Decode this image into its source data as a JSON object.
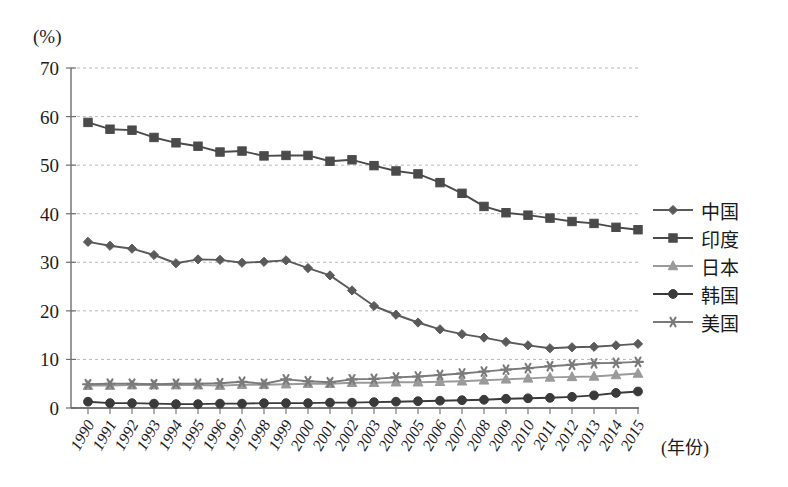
{
  "chart_data": {
    "type": "line",
    "title": "",
    "subtitle": "",
    "xlabel": "(年份)",
    "ylabel": "(%)",
    "ylim": [
      0,
      70
    ],
    "yticks": [
      0,
      10,
      20,
      30,
      40,
      50,
      60,
      70
    ],
    "grid": true,
    "legend_position": "right",
    "categories": [
      "1990",
      "1991",
      "1992",
      "1993",
      "1994",
      "1995",
      "1996",
      "1997",
      "1998",
      "1999",
      "2000",
      "2001",
      "2002",
      "2003",
      "2004",
      "2005",
      "2006",
      "2007",
      "2008",
      "2009",
      "2010",
      "2011",
      "2012",
      "2013",
      "2014",
      "2015"
    ],
    "series": [
      {
        "name": "中国",
        "marker": "diamond",
        "color": "#5a5a5a",
        "values": [
          34.2,
          33.4,
          32.8,
          31.5,
          29.8,
          30.6,
          30.5,
          29.9,
          30.1,
          30.4,
          28.8,
          27.3,
          24.2,
          21.0,
          19.2,
          17.6,
          16.2,
          15.2,
          14.5,
          13.6,
          12.9,
          12.3,
          12.5,
          12.6,
          12.9,
          13.2
        ]
      },
      {
        "name": "印度",
        "marker": "square",
        "color": "#4a4a4a",
        "values": [
          58.8,
          57.4,
          57.2,
          55.7,
          54.6,
          53.9,
          52.7,
          52.9,
          51.9,
          52.0,
          52.0,
          50.8,
          51.1,
          49.9,
          48.8,
          48.2,
          46.4,
          44.2,
          41.5,
          40.2,
          39.7,
          39.1,
          38.4,
          38.0,
          37.2,
          36.7
        ]
      },
      {
        "name": "日本",
        "marker": "triangle",
        "color": "#9a9a9a",
        "values": [
          4.6,
          4.6,
          4.7,
          4.7,
          4.7,
          4.7,
          4.6,
          4.8,
          4.8,
          4.9,
          5.0,
          5.0,
          5.2,
          5.2,
          5.3,
          5.3,
          5.4,
          5.5,
          5.7,
          5.9,
          6.1,
          6.3,
          6.4,
          6.5,
          6.8,
          7.1
        ]
      },
      {
        "name": "韩国",
        "marker": "circle",
        "color": "#3a3a3a",
        "values": [
          1.3,
          1.0,
          1.0,
          0.9,
          0.8,
          0.8,
          0.9,
          0.9,
          1.0,
          1.0,
          1.0,
          1.1,
          1.1,
          1.2,
          1.3,
          1.4,
          1.5,
          1.6,
          1.7,
          1.9,
          2.0,
          2.1,
          2.3,
          2.6,
          3.1,
          3.4
        ]
      },
      {
        "name": "美国",
        "marker": "asterisk",
        "color": "#7a7a7a",
        "values": [
          4.9,
          5.0,
          5.0,
          4.9,
          5.0,
          5.0,
          5.1,
          5.4,
          5.0,
          5.9,
          5.5,
          5.3,
          5.9,
          6.0,
          6.3,
          6.5,
          6.8,
          7.1,
          7.5,
          7.9,
          8.2,
          8.6,
          8.9,
          9.2,
          9.3,
          9.5
        ]
      }
    ]
  }
}
